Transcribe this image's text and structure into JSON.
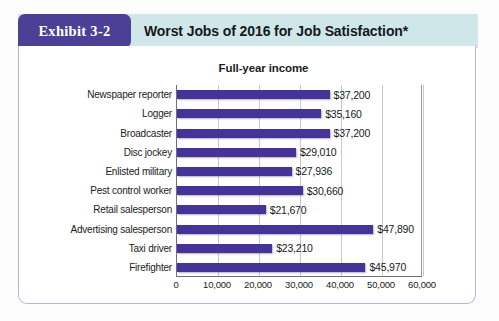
{
  "exhibit": {
    "tab_label": "Exhibit 3-2",
    "title": "Worst Jobs of 2016 for Job Satisfaction*"
  },
  "colors": {
    "bar": "#453397",
    "tab": "#4b3f96",
    "band": "#cfe7e8",
    "border": "#b9b4d4"
  },
  "chart_data": {
    "type": "bar",
    "orientation": "horizontal",
    "title": "Full-year income",
    "xlabel": "",
    "ylabel": "",
    "xlim": [
      0,
      60000
    ],
    "grid": true,
    "legend": false,
    "xticks": [
      "0",
      "10,000",
      "20,000",
      "30,000",
      "40,000",
      "50,000",
      "60,000"
    ],
    "xtick_values": [
      0,
      10000,
      20000,
      30000,
      40000,
      50000,
      60000
    ],
    "categories": [
      "Newspaper reporter",
      "Logger",
      "Broadcaster",
      "Disc jockey",
      "Enlisted military",
      "Pest control worker",
      "Retail salesperson",
      "Advertising salesperson",
      "Taxi driver",
      "Firefighter"
    ],
    "values": [
      37200,
      35160,
      37200,
      29010,
      27936,
      30660,
      21670,
      47890,
      23210,
      45970
    ],
    "value_labels": [
      "$37,200",
      "$35,160",
      "$37,200",
      "$29,010",
      "$27,936",
      "$30,660",
      "$21,670",
      "$47,890",
      "$23,210",
      "$45,970"
    ]
  },
  "footnote": ""
}
